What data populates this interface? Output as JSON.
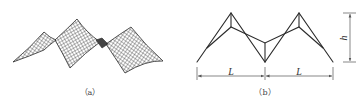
{
  "figure": {
    "panels": [
      {
        "id": "a",
        "caption": "（a）",
        "description": "3D wireframe mesh of a multi-peak tensioned membrane / saddle surface structure"
      },
      {
        "id": "b",
        "caption": "（b）",
        "description": "2D line schematic of a two-span folded/truss structure with span and height dimensions",
        "dimensions": {
          "span_left": "L",
          "span_right": "L",
          "height": "h"
        }
      }
    ]
  },
  "colors": {
    "line": "#2b2b2b",
    "mesh": "#3a3a3a",
    "dimension": "#555555",
    "background": "#ffffff"
  }
}
